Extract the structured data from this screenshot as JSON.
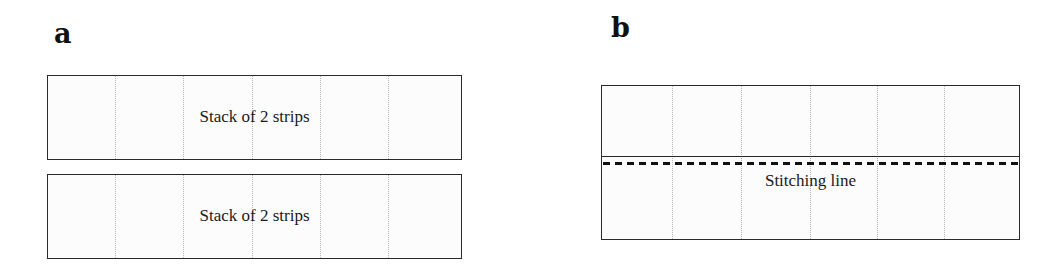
{
  "panels": [
    {
      "label": "a",
      "strips": [
        {
          "text": "Stack of 2 strips"
        },
        {
          "text": "Stack of 2 strips"
        }
      ]
    },
    {
      "label": "b",
      "strip_text": "Stitching line",
      "stitch_style": "dashed"
    }
  ],
  "colors": {
    "outline": "#2a2a2a",
    "fold_lines": "#b8b8b8",
    "stitch": "#111111",
    "background": "#ffffff"
  }
}
